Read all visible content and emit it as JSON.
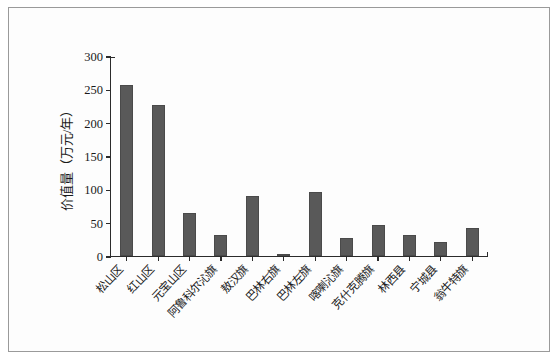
{
  "chart_data": {
    "type": "bar",
    "title": "",
    "xlabel": "",
    "ylabel": "价值量（万元/年）",
    "ylim": [
      0,
      300
    ],
    "yticks": [
      0,
      50,
      100,
      150,
      200,
      250,
      300
    ],
    "ytick_labels": [
      "0",
      "50",
      "100",
      "150",
      "200",
      "250",
      "300"
    ],
    "grid": false,
    "legend": null,
    "bar_color": "#595959",
    "axis_color": "#2b2b2b",
    "categories": [
      "松山区",
      "红山区",
      "元宝山区",
      "阿鲁科尔沁旗",
      "敖汉旗",
      "巴林右旗",
      "巴林左旗",
      "喀喇沁旗",
      "克什克腾旗",
      "林西县",
      "宁城县",
      "翁牛特旗"
    ],
    "values": [
      256,
      226,
      64,
      32,
      90,
      2,
      96,
      27,
      46,
      32,
      21,
      42
    ]
  }
}
